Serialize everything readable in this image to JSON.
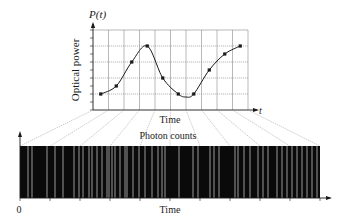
{
  "colors": {
    "ink": "#1a1a1a",
    "grid": "#8a8a8a",
    "fan": "#9a9a9a",
    "strip": "#0a0a0a",
    "photon": "#bdbdbd"
  },
  "top_plot": {
    "y_symbol": "P(t)",
    "y_label": "Optical power",
    "x_symbol": "t",
    "x_label": "Time",
    "box": {
      "x0": 93,
      "x1": 248,
      "y0": 30,
      "y1": 110
    },
    "grid_cols": 10,
    "grid_rows": 5
  },
  "bottom_strip": {
    "title": "Photon counts",
    "x_label": "Time",
    "origin_label": "0",
    "box": {
      "x0": 20,
      "x1": 320,
      "y0": 146,
      "y1": 198
    },
    "tick_count": 10
  },
  "chart_data": {
    "type": "line",
    "title": "",
    "xlabel": "Time",
    "ylabel": "Optical power",
    "x": [
      0.5,
      1.5,
      2.5,
      3.5,
      4.5,
      5.5,
      6.5,
      7.5,
      8.5,
      9.5
    ],
    "series": [
      {
        "name": "P(t) samples",
        "values": [
          1.0,
          1.5,
          3.0,
          4.0,
          2.0,
          1.0,
          1.0,
          2.5,
          3.5,
          4.0
        ]
      }
    ],
    "xlim": [
      0,
      10
    ],
    "ylim": [
      0,
      5
    ],
    "grid": true,
    "photon_count_times": [
      28,
      32,
      47,
      55,
      63,
      74,
      79,
      83,
      89,
      92,
      97,
      102,
      107,
      109,
      112,
      115,
      120,
      125,
      127,
      133,
      139,
      145,
      152,
      158,
      162,
      165,
      179,
      193,
      198,
      210,
      214,
      219,
      235,
      238,
      244,
      250,
      258,
      263,
      268,
      277,
      282,
      287,
      292,
      297,
      302,
      307,
      312,
      317
    ]
  }
}
